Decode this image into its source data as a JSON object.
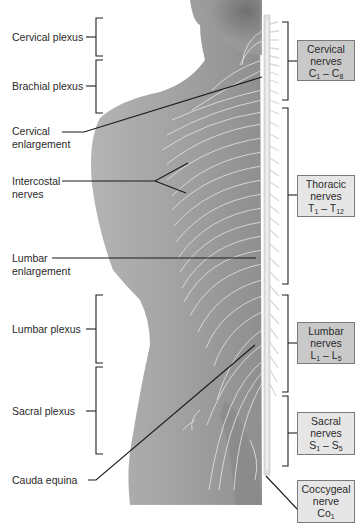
{
  "diagram": {
    "left_labels": [
      {
        "id": "cervical-plexus",
        "text": "Cervical plexus",
        "type": "bracket"
      },
      {
        "id": "brachial-plexus",
        "text": "Brachial plexus",
        "type": "bracket"
      },
      {
        "id": "cervical-enlargement",
        "line1": "Cervical",
        "line2": "enlargement",
        "type": "leader"
      },
      {
        "id": "intercostal-nerves",
        "line1": "Intercostal",
        "line2": "nerves",
        "type": "leader"
      },
      {
        "id": "lumbar-enlargement",
        "line1": "Lumbar",
        "line2": "enlargement",
        "type": "leader"
      },
      {
        "id": "lumbar-plexus",
        "text": "Lumbar plexus",
        "type": "bracket"
      },
      {
        "id": "sacral-plexus",
        "text": "Sacral plexus",
        "type": "bracket"
      },
      {
        "id": "cauda-equina",
        "text": "Cauda equina",
        "type": "leader"
      }
    ],
    "right_boxes": [
      {
        "id": "cervical-nerves",
        "line1": "Cervical",
        "line2": "nerves",
        "range_start": "C",
        "start_sub": "1",
        "dash": " – ",
        "range_end": "C",
        "end_sub": "8",
        "shade": "dark"
      },
      {
        "id": "thoracic-nerves",
        "line1": "Thoracic",
        "line2": "nerves",
        "range_start": "T",
        "start_sub": "1",
        "dash": " – ",
        "range_end": "T",
        "end_sub": "12",
        "shade": "light"
      },
      {
        "id": "lumbar-nerves",
        "line1": "Lumbar",
        "line2": "nerves",
        "range_start": "L",
        "start_sub": "1",
        "dash": " – ",
        "range_end": "L",
        "end_sub": "5",
        "shade": "dark"
      },
      {
        "id": "sacral-nerves",
        "line1": "Sacral",
        "line2": "nerves",
        "range_start": "S",
        "start_sub": "1",
        "dash": " – ",
        "range_end": "S",
        "end_sub": "5",
        "shade": "light"
      },
      {
        "id": "coccygeal-nerve",
        "line1": "Coccygeal",
        "line2": "nerve",
        "range_start": "Co",
        "start_sub": "1",
        "shade": "light"
      }
    ],
    "colors": {
      "box_dark": "#c9c9c9",
      "box_light": "#e6e6e6",
      "box_border": "#7a7a7a",
      "skin": "#a3a3a3",
      "nerve": "#eeeeee",
      "leader_line": "#1a1a1a"
    }
  }
}
